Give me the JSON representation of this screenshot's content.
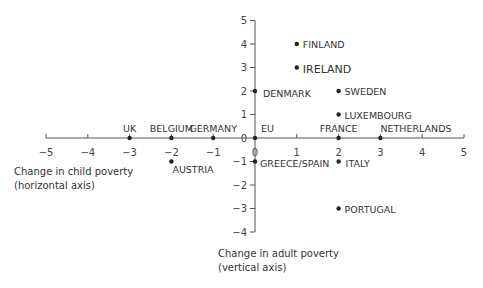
{
  "chart_data": {
    "type": "scatter",
    "title": "",
    "xlabel": "Change in child poverty (horizontal axis)",
    "ylabel": "Change in adult poverty (vertical axis)",
    "xlabel_lines": [
      "Change in child poverty",
      "(horizontal axis)"
    ],
    "ylabel_lines": [
      "Change in adult poverty",
      "(vertical axis)"
    ],
    "xlim": [
      -5,
      5
    ],
    "ylim": [
      -4,
      5
    ],
    "x_ticks": [
      -5,
      -4,
      -3,
      -2,
      -1,
      0,
      1,
      2,
      3,
      4,
      5
    ],
    "x_tick_labels": [
      "−5",
      "−4",
      "−3",
      "−2",
      "−1",
      "0",
      "1",
      "2",
      "3",
      "4",
      "5"
    ],
    "y_ticks": [
      5,
      4,
      3,
      2,
      1,
      0,
      -1,
      -2,
      -3,
      -4
    ],
    "y_tick_labels": [
      "5",
      "4",
      "3",
      "2",
      "1",
      "0",
      "−1",
      "−2",
      "−3",
      "−4"
    ],
    "grid": false,
    "legend": null,
    "points": [
      {
        "label": "FINLAND",
        "x": 1,
        "y": 4
      },
      {
        "label": "IRELAND",
        "x": 1,
        "y": 3
      },
      {
        "label": "DENMARK",
        "x": 0,
        "y": 2
      },
      {
        "label": "SWEDEN",
        "x": 2,
        "y": 2
      },
      {
        "label": "LUXEMBOURG",
        "x": 2,
        "y": 1
      },
      {
        "label": "UK",
        "x": -3,
        "y": 0
      },
      {
        "label": "BELGIUM",
        "x": -2,
        "y": 0
      },
      {
        "label": "GERMANY",
        "x": -1,
        "y": 0
      },
      {
        "label": "EU",
        "x": 0,
        "y": 0
      },
      {
        "label": "FRANCE",
        "x": 2,
        "y": 0
      },
      {
        "label": "NETHERLANDS",
        "x": 3,
        "y": 0
      },
      {
        "label": "AUSTRIA",
        "x": -2,
        "y": -1
      },
      {
        "label": "GREECE/SPAIN",
        "x": 0,
        "y": -1
      },
      {
        "label": "ITALY",
        "x": 2,
        "y": -1
      },
      {
        "label": "PORTUGAL",
        "x": 2,
        "y": -3
      }
    ]
  }
}
